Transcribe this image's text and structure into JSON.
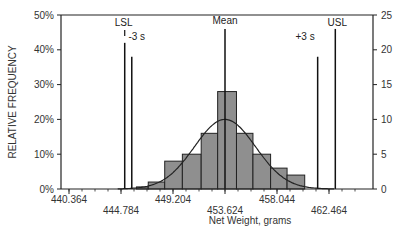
{
  "chart_data": {
    "type": "bar",
    "title": "",
    "xlabel": "Net Weight, grams",
    "ylabel": "RELATIVE FREQUENCY",
    "y2label": "",
    "xticks": [
      "440.364",
      "444.784",
      "449.204",
      "453.624",
      "458.044",
      "462.464"
    ],
    "xtick_values": [
      440.364,
      444.784,
      449.204,
      453.624,
      458.044,
      462.464
    ],
    "yticks_left": [
      "0%",
      "10%",
      "20%",
      "30%",
      "40%",
      "50%"
    ],
    "yticks_right": [
      "0",
      "5",
      "10",
      "15",
      "20",
      "25"
    ],
    "ylim_left": [
      0,
      50
    ],
    "ylim_right": [
      0,
      25
    ],
    "xlim": [
      439.0,
      465.7
    ],
    "grid": false,
    "bins": [
      {
        "x0": 446.1,
        "x1": 447.1,
        "count": 0.3
      },
      {
        "x0": 447.1,
        "x1": 448.5,
        "count": 1
      },
      {
        "x0": 448.5,
        "x1": 450.0,
        "count": 4
      },
      {
        "x0": 450.0,
        "x1": 451.6,
        "count": 5
      },
      {
        "x0": 451.6,
        "x1": 453.0,
        "count": 8
      },
      {
        "x0": 453.0,
        "x1": 454.6,
        "count": 14
      },
      {
        "x0": 454.6,
        "x1": 456.0,
        "count": 8
      },
      {
        "x0": 456.0,
        "x1": 457.5,
        "count": 5
      },
      {
        "x0": 457.5,
        "x1": 458.9,
        "count": 3
      },
      {
        "x0": 458.9,
        "x1": 460.4,
        "count": 2
      }
    ],
    "normal_curve": {
      "mean": 453.624,
      "peak_count": 10,
      "sigma": 2.6
    },
    "reference_lines": [
      {
        "label": "LSL",
        "x": 445.1,
        "top_value_left_pct": 42
      },
      {
        "label": "-3 s",
        "x": 445.7,
        "top_value_left_pct": 38
      },
      {
        "label": "Mean",
        "x": 453.624,
        "top_value_left_pct": 46
      },
      {
        "label": "+3 s",
        "x": 461.5,
        "top_value_left_pct": 38
      },
      {
        "label": "USL",
        "x": 463.0,
        "top_value_left_pct": 46
      }
    ],
    "bar_color": "#8f8f8f"
  }
}
